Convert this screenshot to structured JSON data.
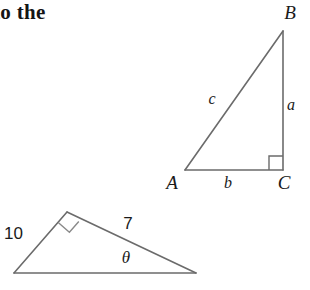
{
  "page": {
    "background_color": "#ffffff",
    "stroke_color": "#6b6b6b",
    "text_color": "#1a1a1a",
    "width": 310,
    "height": 290
  },
  "text_fragment": {
    "content": "to the"
  },
  "figures": [
    {
      "name": "right-triangle-abc",
      "vertices": [
        {
          "label": "A",
          "x": 185,
          "y": 170,
          "label_x": 172,
          "label_y": 189
        },
        {
          "label": "B",
          "x": 283,
          "y": 31,
          "label_x": 286,
          "label_y": 19
        },
        {
          "label": "C",
          "x": 283,
          "y": 170,
          "label_x": 278,
          "label_y": 189
        }
      ],
      "sides": [
        {
          "label": "a",
          "from": "B",
          "to": "C",
          "label_x": 289,
          "label_y": 110
        },
        {
          "label": "b",
          "from": "A",
          "to": "C",
          "label_x": 226,
          "label_y": 188
        },
        {
          "label": "c",
          "from": "A",
          "to": "B",
          "label_x": 210,
          "label_y": 104
        }
      ],
      "right_angle": {
        "at_vertex": "C",
        "size": 14
      }
    },
    {
      "name": "oblique-triangle-with-theta",
      "vertices": [
        {
          "name": "apex",
          "x": 67,
          "y": 212
        },
        {
          "name": "bottom-left",
          "x": 14,
          "y": 273
        },
        {
          "name": "bottom-right",
          "x": 196,
          "y": 273
        }
      ],
      "sides": [
        {
          "label": "10",
          "from": "apex",
          "to": "bottom-left",
          "label_x": 4,
          "label_y": 239
        },
        {
          "label": "7",
          "from": "apex",
          "to": "bottom-right",
          "label_x": 128,
          "label_y": 229
        }
      ],
      "angles": [
        {
          "label": "θ",
          "at_vertex": "bottom-right",
          "label_x": 122,
          "label_y": 263
        }
      ],
      "right_angle": {
        "at_vertex": "apex",
        "size": 13
      }
    }
  ]
}
